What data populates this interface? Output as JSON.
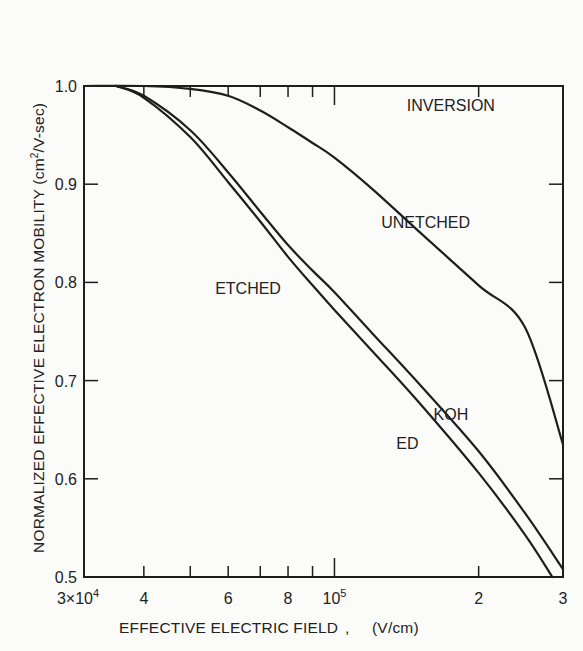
{
  "chart_data": {
    "type": "line",
    "title": "",
    "xlabel": "EFFECTIVE ELECTRIC FIELD , (V/cm)",
    "ylabel": "NORMALIZED EFFECTIVE ELECTRON MOBILITY (cm²/V-sec)",
    "xscale": "log",
    "xlim": [
      30000,
      300000
    ],
    "ylim": [
      0.5,
      1.0
    ],
    "grid": false,
    "x_tick_labels": [
      {
        "value": 30000,
        "label": "3×10⁴"
      },
      {
        "value": 40000,
        "label": "4"
      },
      {
        "value": 60000,
        "label": "6"
      },
      {
        "value": 80000,
        "label": "8"
      },
      {
        "value": 100000,
        "label": "10⁵"
      },
      {
        "value": 200000,
        "label": "2"
      },
      {
        "value": 300000,
        "label": "3"
      }
    ],
    "x_minor_ticks": [
      50000,
      70000,
      90000
    ],
    "y_tick_labels": [
      {
        "value": 1.0,
        "label": "1.0"
      },
      {
        "value": 0.9,
        "label": "0.9"
      },
      {
        "value": 0.8,
        "label": "0.8"
      },
      {
        "value": 0.7,
        "label": "0.7"
      },
      {
        "value": 0.6,
        "label": "0.6"
      },
      {
        "value": 0.5,
        "label": "0.5"
      }
    ],
    "annotations": [
      {
        "text": "INVERSION",
        "x": 175000,
        "y": 0.975
      }
    ],
    "series": [
      {
        "name": "UNETCHED",
        "x": [
          30000,
          40000,
          50000,
          60000,
          70000,
          80000,
          90000,
          100000,
          120000,
          150000,
          200000,
          250000,
          300000
        ],
        "y": [
          1.0,
          1.0,
          0.997,
          0.99,
          0.975,
          0.958,
          0.942,
          0.927,
          0.895,
          0.852,
          0.797,
          0.754,
          0.635
        ]
      },
      {
        "name": "KOH",
        "x": [
          35000,
          40000,
          50000,
          60000,
          70000,
          80000,
          90000,
          100000,
          120000,
          150000,
          200000,
          250000,
          300000
        ],
        "y": [
          1.0,
          0.99,
          0.955,
          0.912,
          0.872,
          0.838,
          0.812,
          0.79,
          0.748,
          0.697,
          0.628,
          0.565,
          0.508
        ]
      },
      {
        "name": "ED",
        "x": [
          35000,
          40000,
          50000,
          60000,
          70000,
          80000,
          90000,
          100000,
          120000,
          150000,
          200000,
          250000,
          285000
        ],
        "y": [
          1.0,
          0.988,
          0.948,
          0.902,
          0.862,
          0.826,
          0.797,
          0.772,
          0.73,
          0.678,
          0.606,
          0.543,
          0.5
        ]
      }
    ],
    "curve_labels": [
      {
        "text": "UNETCHED",
        "x": 155000,
        "y": 0.855
      },
      {
        "text": "ETCHED",
        "x": 66000,
        "y": 0.788
      },
      {
        "text": "KOH",
        "x": 175000,
        "y": 0.66
      },
      {
        "text": "ED",
        "x": 142000,
        "y": 0.63
      }
    ]
  }
}
